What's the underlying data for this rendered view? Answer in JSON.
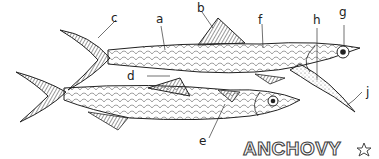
{
  "title": "ANCHOVY",
  "title_icon": "star-outline-icon",
  "labels": {
    "a": "a",
    "b": "b",
    "c": "c",
    "d": "d",
    "e": "e",
    "f": "f",
    "g": "g",
    "h": "h",
    "j": "j"
  },
  "colors": {
    "ink": "#222222",
    "background": "#ffffff",
    "fin_shade": "#555555"
  }
}
